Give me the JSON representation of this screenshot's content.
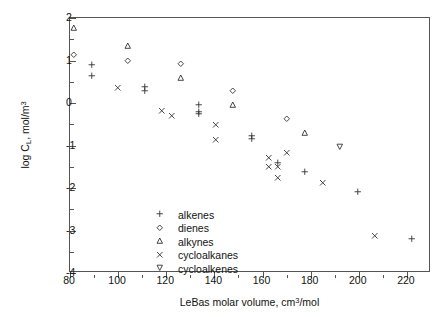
{
  "chart_data": {
    "type": "scatter",
    "title": "",
    "xlabel": "LeBas molar volume, cm3/mol",
    "ylabel": "log CL, mol/m3",
    "xlim": [
      80,
      230
    ],
    "ylim": [
      -4,
      2
    ],
    "xticks": [
      80,
      100,
      120,
      140,
      160,
      180,
      200,
      220
    ],
    "xtick_labels": [
      "80",
      "100",
      "120",
      "140",
      "160",
      "180",
      "200",
      "220"
    ],
    "xminor_ticks": [
      90,
      110,
      130,
      150,
      170,
      190,
      210,
      230
    ],
    "yticks": [
      2,
      1,
      0,
      -1,
      -2,
      -3,
      -4
    ],
    "ytick_labels": [
      "2",
      "1",
      "0",
      "-1",
      "-2",
      "-3",
      "-4"
    ],
    "yminor_ticks": [
      1.5,
      0.5,
      -0.5,
      -1.5,
      -2.5,
      -3.5
    ],
    "grid": false,
    "legend_position": "lower-left-inside",
    "series": [
      {
        "name": "alkenes",
        "marker": "plus",
        "points": [
          [
            89.5,
            0.88
          ],
          [
            89.5,
            0.62
          ],
          [
            111.5,
            0.36
          ],
          [
            111.5,
            0.28
          ],
          [
            134.0,
            -0.06
          ],
          [
            134.0,
            -0.22
          ],
          [
            134.0,
            -0.28
          ],
          [
            155.8,
            -0.78
          ],
          [
            155.8,
            -0.86
          ],
          [
            178.0,
            -1.64
          ],
          [
            200.0,
            -2.1
          ],
          [
            222.5,
            -3.22
          ],
          [
            166.5,
            -1.42
          ]
        ]
      },
      {
        "name": "dienes",
        "marker": "diamond",
        "points": [
          [
            82.0,
            1.12
          ],
          [
            104.5,
            0.97
          ],
          [
            126.5,
            0.9
          ],
          [
            148.0,
            0.28
          ],
          [
            170.5,
            -0.38
          ]
        ]
      },
      {
        "name": "alkynes",
        "marker": "triangle-up",
        "points": [
          [
            82.0,
            1.76
          ],
          [
            104.5,
            1.34
          ],
          [
            126.5,
            0.58
          ],
          [
            148.0,
            -0.06
          ],
          [
            178.0,
            -0.72
          ]
        ]
      },
      {
        "name": "cycloalkanes",
        "marker": "cross",
        "points": [
          [
            100.0,
            0.33
          ],
          [
            118.3,
            -0.2
          ],
          [
            122.5,
            -0.31
          ],
          [
            141.0,
            -0.54
          ],
          [
            141.0,
            -0.88
          ],
          [
            163.0,
            -1.3
          ],
          [
            163.0,
            -1.51
          ],
          [
            166.5,
            -1.51
          ],
          [
            166.5,
            -1.78
          ],
          [
            170.5,
            -1.19
          ],
          [
            185.5,
            -1.9
          ],
          [
            207.0,
            -3.13
          ]
        ]
      },
      {
        "name": "cycloalkenes",
        "marker": "triangle-down",
        "points": [
          [
            192.5,
            -1.04
          ]
        ]
      }
    ]
  },
  "legend": {
    "entries": [
      {
        "label": "alkenes",
        "marker": "plus"
      },
      {
        "label": "dienes",
        "marker": "diamond"
      },
      {
        "label": "alkynes",
        "marker": "triangle-up"
      },
      {
        "label": "cycloalkanes",
        "marker": "cross"
      },
      {
        "label": "cycloalkenes",
        "marker": "triangle-down"
      }
    ]
  },
  "axis_label_parts": {
    "y_prefix": "log C",
    "y_sub": "L",
    "y_mid": ", mol/m",
    "y_sup": "3",
    "x_prefix": "LeBas molar volume, cm",
    "x_sup": "3",
    "x_suffix": "/mol"
  },
  "style": {
    "marker_color": "#333333",
    "axis_color": "#555555",
    "background": "#ffffff"
  }
}
